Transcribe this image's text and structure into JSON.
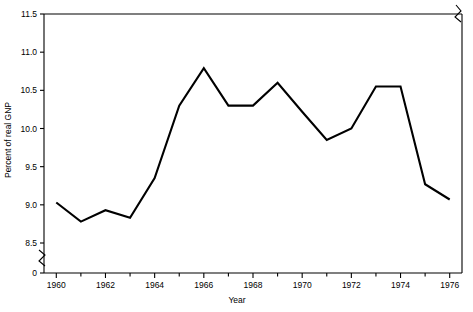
{
  "chart_data": {
    "type": "line",
    "title": "",
    "xlabel": "Year",
    "ylabel": "Percent of real GNP",
    "x": [
      1960,
      1961,
      1962,
      1963,
      1964,
      1965,
      1966,
      1967,
      1968,
      1969,
      1970,
      1971,
      1972,
      1973,
      1974,
      1975,
      1976
    ],
    "values": [
      9.03,
      8.78,
      8.93,
      8.83,
      9.35,
      10.3,
      10.79,
      10.3,
      10.3,
      10.6,
      10.22,
      9.85,
      10.0,
      10.55,
      10.55,
      9.27,
      9.07
    ],
    "series": [
      {
        "name": "Percent of real GNP",
        "values": [
          9.03,
          8.78,
          8.93,
          8.83,
          9.35,
          10.3,
          10.79,
          10.3,
          10.3,
          10.6,
          10.22,
          9.85,
          10.0,
          10.55,
          10.55,
          9.27,
          9.07
        ]
      }
    ],
    "xlim": [
      1959.5,
      1976.5
    ],
    "ylim": [
      8.5,
      11.5
    ],
    "x_tick_labels": [
      "1960",
      "1962",
      "1964",
      "1966",
      "1968",
      "1970",
      "1972",
      "1974",
      "1976"
    ],
    "x_tick_values": [
      1960,
      1962,
      1964,
      1966,
      1968,
      1970,
      1972,
      1974,
      1976
    ],
    "x_minor_ticks": [
      1961,
      1963,
      1965,
      1967,
      1969,
      1971,
      1973,
      1975
    ],
    "y_tick_labels": [
      "0",
      "8.5",
      "9.0",
      "9.5",
      "10.0",
      "10.5",
      "11.0",
      "11.5"
    ],
    "y_tick_values": [
      0,
      8.5,
      9.0,
      9.5,
      10.0,
      10.5,
      11.0,
      11.5
    ],
    "grid": false,
    "legend": "none",
    "axis_break": {
      "axis": "y",
      "between": [
        "0",
        "8.5"
      ],
      "note": "zigzag break symbol on vertical axis below 8.5"
    },
    "line_color": "#000000",
    "background_color": "#ffffff"
  }
}
